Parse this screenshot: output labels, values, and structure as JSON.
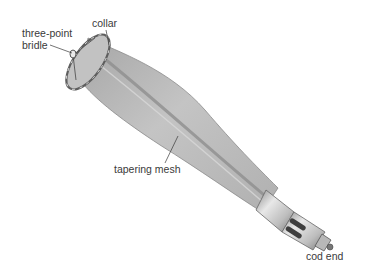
{
  "diagram": {
    "labels": {
      "bridle": "three-point\nbridle",
      "collar": "collar",
      "mesh": "tapering mesh",
      "cod_end": "cod end"
    },
    "colors": {
      "mesh_fill": "#b9b9b9",
      "mesh_shadow": "#8e8e8e",
      "mesh_highlight": "#d6d6d6",
      "collar": "#6e6e6e",
      "cod_end_metal": "#c8c8c8",
      "cod_end_dark": "#4a4a4a",
      "leader_line": "#3a3a3a",
      "label_text": "#3a3a3a"
    }
  }
}
